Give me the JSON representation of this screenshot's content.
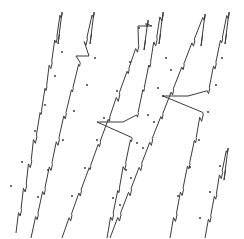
{
  "figure": {
    "title": "",
    "background_color": "#ffffff",
    "line_color": "#3b3b3b",
    "marker_color": "#2b2b2b",
    "width": 244,
    "height": 239
  },
  "chart_data": {
    "type": "line",
    "title": "",
    "xlabel": "",
    "ylabel": "",
    "xlim": [
      0,
      244
    ],
    "ylim": [
      0,
      239
    ],
    "grid": false,
    "legend": null,
    "axes_visible": false,
    "series": [
      {
        "name": "ramp-1",
        "points": [
          [
            16,
            232
          ],
          [
            19,
            229
          ],
          [
            22,
            224
          ],
          [
            25,
            221
          ],
          [
            28,
            216
          ],
          [
            31,
            213
          ],
          [
            34,
            208
          ],
          [
            37,
            205
          ],
          [
            40,
            200
          ],
          [
            43,
            197
          ],
          [
            46,
            191
          ],
          [
            49,
            188
          ],
          [
            52,
            183
          ],
          [
            55,
            180
          ],
          [
            58,
            175
          ],
          [
            61,
            172
          ],
          [
            62,
            165
          ],
          [
            64,
            158
          ],
          [
            66,
            151
          ],
          [
            68,
            144
          ],
          [
            70,
            137
          ],
          [
            72,
            130
          ],
          [
            74,
            123
          ],
          [
            75,
            116
          ],
          [
            77,
            109
          ],
          [
            79,
            102
          ],
          [
            80,
            95
          ],
          [
            82,
            88
          ],
          [
            84,
            81
          ],
          [
            86,
            74
          ],
          [
            88,
            67
          ],
          [
            90,
            60
          ],
          [
            92,
            52
          ],
          [
            94,
            45
          ],
          [
            96,
            38
          ],
          [
            98,
            31
          ],
          [
            61,
            14
          ],
          [
            62,
            24
          ],
          [
            60,
            13
          ],
          [
            63,
            40
          ]
        ]
      },
      {
        "name": "ramp-2",
        "points": [
          [
            31,
            238
          ],
          [
            36,
            233
          ],
          [
            38,
            228
          ],
          [
            41,
            225
          ]
        ]
      }
    ],
    "ramps": [
      {
        "id": "ramp-a",
        "start": [
          16,
          233
        ],
        "peak": [
          62,
          12
        ],
        "drop_bottom": [
          58,
          44
        ],
        "steps": 9
      },
      {
        "id": "ramp-b",
        "start": [
          31,
          238
        ],
        "peak": [
          94,
          12
        ],
        "drop_bottom": [
          90,
          44
        ],
        "steps": 9,
        "plateau": {
          "y": 56,
          "x_from": 76,
          "x_to": 89
        }
      },
      {
        "id": "ramp-c",
        "start": [
          62,
          238
        ],
        "peak": [
          148,
          20
        ],
        "drop_bottom": [
          144,
          50
        ],
        "steps": 9,
        "plateau": {
          "y": 26,
          "x_from": 138,
          "x_to": 152
        }
      },
      {
        "id": "ramp-d",
        "start": [
          107,
          238
        ],
        "peak": [
          163,
          12
        ],
        "drop_bottom": [
          159,
          44
        ],
        "steps": 9,
        "plateau": {
          "y": 122,
          "x_from": 97,
          "x_to": 123
        }
      },
      {
        "id": "ramp-e",
        "start": [
          110,
          238
        ],
        "peak": [
          205,
          14
        ],
        "drop_bottom": [
          201,
          46
        ],
        "steps": 9
      },
      {
        "id": "ramp-f",
        "start": [
          170,
          238
        ],
        "peak": [
          229,
          12
        ],
        "drop_bottom": [
          225,
          44
        ],
        "steps": 9,
        "plateau": {
          "y": 96,
          "x_from": 163,
          "x_to": 188
        }
      },
      {
        "id": "ramp-g",
        "start": [
          205,
          238
        ],
        "peak": [
          228,
          148
        ],
        "drop_bottom": [
          224,
          180
        ],
        "steps": 4
      }
    ],
    "marker_points": [
      [
        11,
        186
      ],
      [
        22,
        162
      ],
      [
        35,
        131
      ],
      [
        45,
        105
      ],
      [
        55,
        76
      ],
      [
        62,
        52
      ],
      [
        38,
        197
      ],
      [
        48,
        170
      ],
      [
        63,
        140
      ],
      [
        74,
        111
      ],
      [
        87,
        85
      ],
      [
        95,
        58
      ],
      [
        72,
        196
      ],
      [
        85,
        168
      ],
      [
        97,
        140
      ],
      [
        104,
        118
      ],
      [
        117,
        91
      ],
      [
        130,
        62
      ],
      [
        139,
        28
      ],
      [
        113,
        198
      ],
      [
        126,
        170
      ],
      [
        137,
        143
      ],
      [
        148,
        115
      ],
      [
        158,
        88
      ],
      [
        166,
        58
      ],
      [
        120,
        205
      ],
      [
        131,
        178
      ],
      [
        143,
        148
      ],
      [
        154,
        122
      ],
      [
        163,
        96
      ],
      [
        171,
        70
      ],
      [
        178,
        196
      ],
      [
        190,
        167
      ],
      [
        199,
        140
      ],
      [
        208,
        112
      ],
      [
        216,
        85
      ],
      [
        222,
        58
      ],
      [
        200,
        218
      ],
      [
        210,
        192
      ],
      [
        220,
        166
      ]
    ]
  }
}
